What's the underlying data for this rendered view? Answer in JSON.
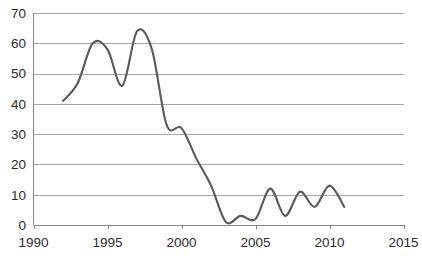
{
  "chart_data": {
    "type": "line",
    "title": "",
    "subtitle": "",
    "xlabel": "",
    "ylabel": "",
    "xlim": [
      1990,
      2015
    ],
    "ylim": [
      0,
      70
    ],
    "grid": true,
    "legend": false,
    "legend_position": "none",
    "line_color": "#595959",
    "grid_color": "#a6a6a6",
    "axis_color": "#868686",
    "background_color": "#ffffff",
    "xticks": [
      1990,
      1995,
      2000,
      2005,
      2010,
      2015
    ],
    "xtick_labels": [
      "1990",
      "1995",
      "2000",
      "2005",
      "2010",
      "2015"
    ],
    "yticks": [
      0,
      10,
      20,
      30,
      40,
      50,
      60,
      70
    ],
    "ytick_labels": [
      "0",
      "10",
      "20",
      "30",
      "40",
      "50",
      "60",
      "70"
    ],
    "x": [
      1992,
      1993,
      1994,
      1995,
      1996,
      1997,
      1998,
      1999,
      2000,
      2001,
      2002,
      2003,
      2004,
      2005,
      2006,
      2007,
      2008,
      2009,
      2010,
      2011
    ],
    "values": [
      41,
      47,
      60,
      58,
      46,
      64,
      58,
      33,
      32,
      22,
      13,
      1,
      3,
      2,
      12,
      3,
      11,
      6,
      13,
      6
    ],
    "series": [
      {
        "name": "series-1",
        "color": "#595959",
        "x": [
          1992,
          1993,
          1994,
          1995,
          1996,
          1997,
          1998,
          1999,
          2000,
          2001,
          2002,
          2003,
          2004,
          2005,
          2006,
          2007,
          2008,
          2009,
          2010,
          2011
        ],
        "values": [
          41,
          47,
          60,
          58,
          46,
          64,
          58,
          33,
          32,
          22,
          13,
          1,
          3,
          2,
          12,
          3,
          11,
          6,
          13,
          6
        ]
      }
    ],
    "annotations": []
  }
}
